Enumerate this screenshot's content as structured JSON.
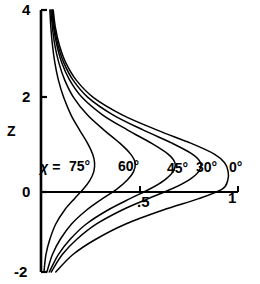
{
  "chart_data": {
    "type": "line",
    "title": "",
    "xlabel": "",
    "ylabel": "Z",
    "xlim": [
      0,
      1.02
    ],
    "ylim": [
      -2,
      4
    ],
    "grid": false,
    "legend_position": "inline-curve-labels",
    "x_ticks": [
      {
        "value": 0.5,
        "label": ".5"
      },
      {
        "value": 1.0,
        "label": "1"
      }
    ],
    "y_ticks": [
      {
        "value": 4,
        "label": "4"
      },
      {
        "value": 2,
        "label": "2"
      },
      {
        "value": 0,
        "label": "0"
      },
      {
        "value": -2,
        "label": "-2"
      }
    ],
    "parameter_symbol": "χ =",
    "series": [
      {
        "name": "75°",
        "label": "75°",
        "points": [
          [
            0.045,
            4.0
          ],
          [
            0.05,
            3.6
          ],
          [
            0.058,
            3.2
          ],
          [
            0.07,
            2.8
          ],
          [
            0.088,
            2.4
          ],
          [
            0.115,
            2.0
          ],
          [
            0.152,
            1.6
          ],
          [
            0.196,
            1.25
          ],
          [
            0.236,
            0.95
          ],
          [
            0.262,
            0.7
          ],
          [
            0.272,
            0.5
          ],
          [
            0.268,
            0.3
          ],
          [
            0.248,
            0.1
          ],
          [
            0.215,
            -0.1
          ],
          [
            0.17,
            -0.32
          ],
          [
            0.12,
            -0.58
          ],
          [
            0.075,
            -0.9
          ],
          [
            0.045,
            -1.25
          ],
          [
            0.025,
            -1.6
          ],
          [
            0.015,
            -2.0
          ]
        ]
      },
      {
        "name": "60°",
        "label": "60°",
        "points": [
          [
            0.05,
            4.0
          ],
          [
            0.058,
            3.6
          ],
          [
            0.07,
            3.2
          ],
          [
            0.09,
            2.8
          ],
          [
            0.12,
            2.4
          ],
          [
            0.165,
            2.0
          ],
          [
            0.235,
            1.6
          ],
          [
            0.32,
            1.25
          ],
          [
            0.4,
            0.95
          ],
          [
            0.455,
            0.7
          ],
          [
            0.478,
            0.5
          ],
          [
            0.47,
            0.3
          ],
          [
            0.437,
            0.1
          ],
          [
            0.385,
            -0.1
          ],
          [
            0.312,
            -0.32
          ],
          [
            0.232,
            -0.58
          ],
          [
            0.155,
            -0.9
          ],
          [
            0.098,
            -1.25
          ],
          [
            0.058,
            -1.6
          ],
          [
            0.03,
            -2.0
          ]
        ]
      },
      {
        "name": "45°",
        "label": "45°",
        "points": [
          [
            0.055,
            4.0
          ],
          [
            0.064,
            3.6
          ],
          [
            0.08,
            3.2
          ],
          [
            0.105,
            2.8
          ],
          [
            0.145,
            2.4
          ],
          [
            0.208,
            2.0
          ],
          [
            0.312,
            1.6
          ],
          [
            0.44,
            1.25
          ],
          [
            0.56,
            0.95
          ],
          [
            0.645,
            0.7
          ],
          [
            0.68,
            0.5
          ],
          [
            0.67,
            0.3
          ],
          [
            0.625,
            0.1
          ],
          [
            0.552,
            -0.1
          ],
          [
            0.452,
            -0.32
          ],
          [
            0.34,
            -0.58
          ],
          [
            0.23,
            -0.9
          ],
          [
            0.148,
            -1.25
          ],
          [
            0.088,
            -1.6
          ],
          [
            0.042,
            -2.0
          ]
        ]
      },
      {
        "name": "30°",
        "label": "30°",
        "points": [
          [
            0.058,
            4.0
          ],
          [
            0.068,
            3.6
          ],
          [
            0.086,
            3.2
          ],
          [
            0.115,
            2.8
          ],
          [
            0.162,
            2.4
          ],
          [
            0.238,
            2.0
          ],
          [
            0.365,
            1.6
          ],
          [
            0.52,
            1.25
          ],
          [
            0.665,
            0.95
          ],
          [
            0.768,
            0.7
          ],
          [
            0.81,
            0.5
          ],
          [
            0.8,
            0.3
          ],
          [
            0.748,
            0.1
          ],
          [
            0.662,
            -0.1
          ],
          [
            0.545,
            -0.32
          ],
          [
            0.412,
            -0.58
          ],
          [
            0.282,
            -0.9
          ],
          [
            0.182,
            -1.25
          ],
          [
            0.108,
            -1.6
          ],
          [
            0.052,
            -2.0
          ]
        ]
      },
      {
        "name": "0°",
        "label": "0°",
        "points": [
          [
            0.062,
            4.0
          ],
          [
            0.073,
            3.6
          ],
          [
            0.093,
            3.2
          ],
          [
            0.125,
            2.8
          ],
          [
            0.178,
            2.4
          ],
          [
            0.265,
            2.0
          ],
          [
            0.412,
            1.6
          ],
          [
            0.59,
            1.25
          ],
          [
            0.76,
            0.95
          ],
          [
            0.88,
            0.7
          ],
          [
            0.932,
            0.5
          ],
          [
            0.95,
            0.3
          ],
          [
            0.948,
            0.1
          ],
          [
            0.92,
            -0.1
          ],
          [
            0.8,
            -0.32
          ],
          [
            0.62,
            -0.58
          ],
          [
            0.43,
            -0.9
          ],
          [
            0.278,
            -1.25
          ],
          [
            0.162,
            -1.6
          ],
          [
            0.075,
            -2.0
          ]
        ]
      }
    ]
  },
  "axes": {
    "y_title": "Z",
    "y_tick_4": "4",
    "y_tick_2": "2",
    "y_tick_0": "0",
    "y_tick_m2": "-2",
    "x_tick_half": ".5",
    "x_tick_one": "1"
  },
  "labels": {
    "chi_param": "χ =",
    "curve_75": "75°",
    "curve_60": "60°",
    "curve_45": "45°",
    "curve_30": "30°",
    "curve_0": "0°"
  }
}
